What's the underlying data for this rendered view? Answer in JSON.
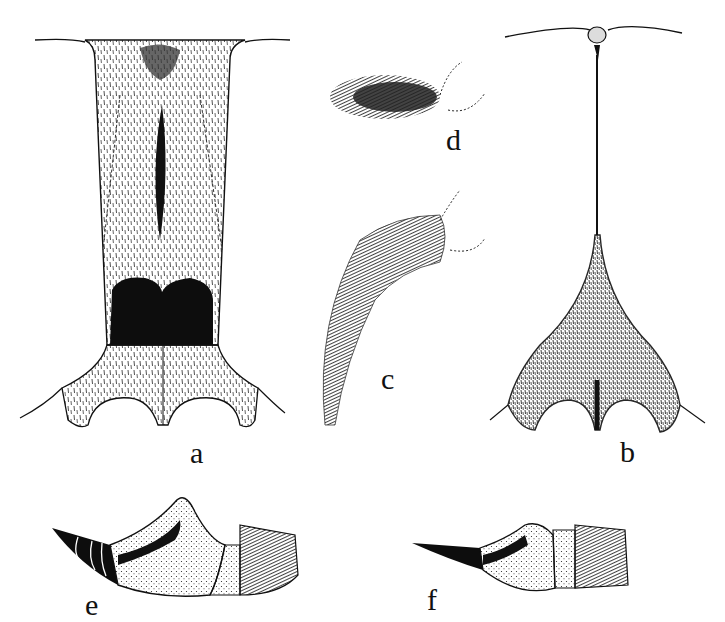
{
  "figure": {
    "panels": [
      {
        "id": "a",
        "label": "a",
        "description": "Ventral view of elongate sternal plate with median dark streak and dark bilobed basal patch, hairy, two concave posterior lobes"
      },
      {
        "id": "b",
        "label": "b",
        "description": "Narrow median ridge with small apical knob widening into dark triangular base with two concave lobes"
      },
      {
        "id": "c",
        "label": "c",
        "description": "Curved densely setose appendage with dotted outline of attachment"
      },
      {
        "id": "d",
        "label": "d",
        "description": "Small oval densely setose appendage with dotted outline of attachment"
      },
      {
        "id": "e",
        "label": "e",
        "description": "Lateral view of terminal segments with banded dark conical tip, stippled segment and setose terminal segment"
      },
      {
        "id": "f",
        "label": "f",
        "description": "Lateral view of terminal segments with slender banded conical tip, stippled segments and setose terminal segment"
      }
    ],
    "colors": {
      "ink": "#111111",
      "paper": "#ffffff"
    }
  }
}
